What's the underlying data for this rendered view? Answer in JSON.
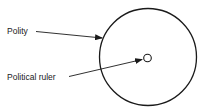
{
  "diagram": {
    "labels": {
      "polity": "Polity",
      "ruler": "Political ruler"
    },
    "colors": {
      "stroke": "#1a1a1a",
      "background": "#ffffff"
    }
  }
}
